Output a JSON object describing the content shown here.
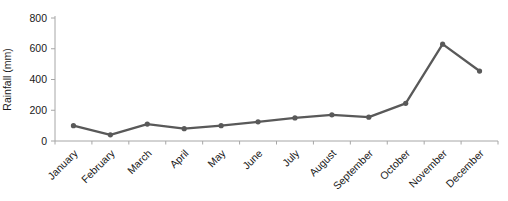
{
  "chart_data": {
    "type": "line",
    "title": "",
    "xlabel": "",
    "ylabel": "Rainfall (mm)",
    "categories": [
      "January",
      "February",
      "March",
      "April",
      "May",
      "June",
      "July",
      "August",
      "September",
      "October",
      "November",
      "December"
    ],
    "series": [
      {
        "name": "Rainfall",
        "values": [
          100,
          40,
          110,
          80,
          100,
          125,
          150,
          170,
          155,
          245,
          630,
          455
        ]
      }
    ],
    "ylim": [
      0,
      800
    ],
    "ytick_step": 200,
    "yticks": [
      0,
      200,
      400,
      600,
      800
    ],
    "grid": "off",
    "legend": "none",
    "marker": "circle",
    "colors": {
      "line": "#595959",
      "marker": "#595959",
      "axis": "#a6a6a6",
      "text": "#1a1a1a"
    }
  }
}
